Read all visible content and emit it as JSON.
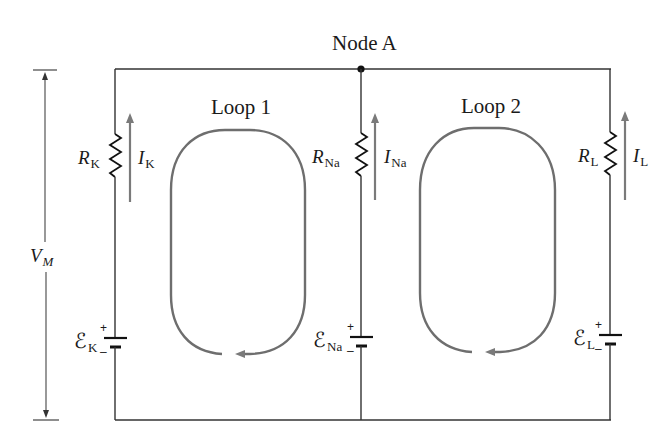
{
  "diagram": {
    "node_label": "Node A",
    "loops": [
      {
        "label": "Loop 1"
      },
      {
        "label": "Loop 2"
      }
    ],
    "membrane_voltage": {
      "symbol": "V",
      "subscript": "M"
    },
    "branches": [
      {
        "ion": "K",
        "resistor": {
          "symbol": "R",
          "subscript": "K"
        },
        "current": {
          "symbol": "I",
          "subscript": "K"
        },
        "emf": {
          "symbol": "ℰ",
          "subscript": "K",
          "plus": "+",
          "minus": "–"
        }
      },
      {
        "ion": "Na",
        "resistor": {
          "symbol": "R",
          "subscript": "Na"
        },
        "current": {
          "symbol": "I",
          "subscript": "Na"
        },
        "emf": {
          "symbol": "ℰ",
          "subscript": "Na",
          "plus": "+",
          "minus": "–"
        }
      },
      {
        "ion": "L",
        "resistor": {
          "symbol": "R",
          "subscript": "L"
        },
        "current": {
          "symbol": "I",
          "subscript": "L"
        },
        "emf": {
          "symbol": "ℰ",
          "subscript": "L",
          "plus": "+",
          "minus": "–"
        }
      }
    ],
    "colors": {
      "wire": "#333333",
      "loop_arrow": "#6e6e6e",
      "current_arrow": "#7a7a7a",
      "text": "#1a1a1a"
    }
  }
}
